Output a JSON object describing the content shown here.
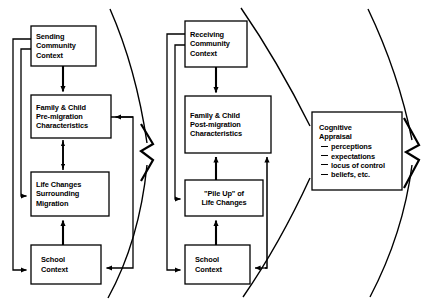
{
  "diagram": {
    "stroke_color": "#000000",
    "background_color": "#ffffff",
    "panels": [
      {
        "name": "sending-panel",
        "boxes": [
          {
            "id": "sending-community-context",
            "lines": [
              "Sending",
              "Community",
              "Context"
            ],
            "x": 31,
            "y": 26,
            "w": 65,
            "h": 40
          },
          {
            "id": "family-child-pre-migration",
            "lines": [
              "Family & Child",
              "Pre-migration",
              "Characteristics"
            ],
            "x": 31,
            "y": 95,
            "w": 80,
            "h": 43
          },
          {
            "id": "life-changes-surrounding-migration",
            "lines": [
              "Life Changes",
              "Surrounding",
              "Migration"
            ],
            "x": 31,
            "y": 172,
            "w": 78,
            "h": 44
          },
          {
            "id": "school-context-sending",
            "lines": [
              "School",
              "Context"
            ],
            "x": 31,
            "y": 245,
            "w": 70,
            "h": 39
          }
        ]
      },
      {
        "name": "receiving-panel",
        "boxes": [
          {
            "id": "receiving-community-context",
            "lines": [
              "Receiving",
              "Community",
              "Context"
            ],
            "x": 185,
            "y": 21,
            "w": 62,
            "h": 46
          },
          {
            "id": "family-child-post-migration",
            "lines": [
              "Family & Child",
              "Post-migration",
              "Characteristics"
            ],
            "x": 185,
            "y": 96,
            "w": 86,
            "h": 57
          },
          {
            "id": "pile-up-of-life-changes",
            "lines": [
              "\"Pile Up\" of",
              "Life Changes"
            ],
            "x": 185,
            "y": 180,
            "w": 78,
            "h": 36
          },
          {
            "id": "school-context-receiving",
            "lines": [
              "School",
              "Context"
            ],
            "x": 185,
            "y": 245,
            "w": 65,
            "h": 39
          }
        ]
      },
      {
        "name": "appraisal-panel",
        "boxes": [
          {
            "id": "cognitive-appraisal",
            "heading": [
              "Cognitive",
              "Appraisal"
            ],
            "bullets": [
              "perceptions",
              "expectations",
              "locus of control",
              "beliefs, etc."
            ],
            "x": 312,
            "y": 112,
            "w": 90,
            "h": 78
          }
        ]
      }
    ],
    "connectors": {
      "zigzag_arrows": [
        "divider-arrow-left",
        "divider-arrow-right"
      ],
      "feedback_rails": [
        "sending-outer-rail",
        "sending-inner-rail",
        "receiving-outer-rail",
        "receiving-inner-rail"
      ],
      "double_headed": [
        "pre-migration-to-life-changes"
      ]
    }
  }
}
